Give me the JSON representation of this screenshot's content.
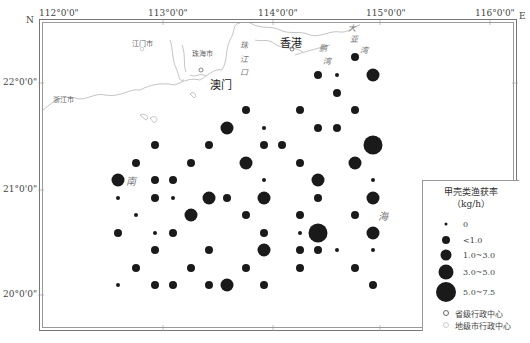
{
  "map": {
    "north_label": "N",
    "east_label": "E",
    "longitude_ticks": [
      {
        "label": "112°0'0\"",
        "x": 40
      },
      {
        "label": "113°0'0\"",
        "x": 163
      },
      {
        "label": "114°0'0\"",
        "x": 273
      },
      {
        "label": "115°0'0\"",
        "x": 380
      },
      {
        "label": "116°0'0\"",
        "x": 490
      }
    ],
    "latitude_ticks": [
      {
        "label": "22°0'0\"",
        "y": 83
      },
      {
        "label": "21°0'0\"",
        "y": 190
      },
      {
        "label": "20°0'0\"",
        "y": 295
      }
    ],
    "places": [
      {
        "name": "江门市",
        "x": 132,
        "y": 42,
        "type": "city"
      },
      {
        "name": "珠海市",
        "x": 196,
        "y": 52,
        "type": "city"
      },
      {
        "name": "浙江市",
        "x": 53,
        "y": 97,
        "type": "city"
      },
      {
        "name": "澳门",
        "x": 211,
        "y": 83,
        "type": "major"
      },
      {
        "name": "香港",
        "x": 282,
        "y": 42,
        "type": "major"
      }
    ],
    "water_labels": [
      {
        "text": "珠",
        "x": 243,
        "y": 45
      },
      {
        "text": "江",
        "x": 243,
        "y": 59
      },
      {
        "text": "口",
        "x": 243,
        "y": 72
      },
      {
        "text": "大",
        "x": 348,
        "y": 27
      },
      {
        "text": "亚",
        "x": 350,
        "y": 38
      },
      {
        "text": "湾",
        "x": 361,
        "y": 49
      },
      {
        "text": "鹏",
        "x": 320,
        "y": 47
      },
      {
        "text": "湾",
        "x": 324,
        "y": 60
      },
      {
        "text": "南",
        "x": 129,
        "y": 180
      },
      {
        "text": "海",
        "x": 382,
        "y": 215
      }
    ]
  },
  "stations": [
    {
      "x": 355,
      "y": 57,
      "size": "1.0~3.0"
    },
    {
      "x": 318,
      "y": 75,
      "size": "1.0~3.0"
    },
    {
      "x": 337,
      "y": 75,
      "size": "<1.0"
    },
    {
      "x": 373,
      "y": 75,
      "size": "3.0~5.0"
    },
    {
      "x": 337,
      "y": 93,
      "size": "1.0~3.0"
    },
    {
      "x": 246,
      "y": 110,
      "size": "1.0~3.0"
    },
    {
      "x": 300,
      "y": 110,
      "size": "1.0~3.0"
    },
    {
      "x": 355,
      "y": 110,
      "size": "1.0~3.0"
    },
    {
      "x": 227,
      "y": 128,
      "size": "3.0~5.0"
    },
    {
      "x": 264,
      "y": 128,
      "size": "<1.0"
    },
    {
      "x": 318,
      "y": 128,
      "size": "1.0~3.0"
    },
    {
      "x": 337,
      "y": 128,
      "size": "1.0~3.0"
    },
    {
      "x": 155,
      "y": 145,
      "size": "1.0~3.0"
    },
    {
      "x": 209,
      "y": 145,
      "size": "1.0~3.0"
    },
    {
      "x": 264,
      "y": 145,
      "size": "1.0~3.0"
    },
    {
      "x": 282,
      "y": 145,
      "size": "1.0~3.0"
    },
    {
      "x": 373,
      "y": 145,
      "size": "5.0~7.5"
    },
    {
      "x": 136,
      "y": 163,
      "size": "1.0~3.0"
    },
    {
      "x": 191,
      "y": 163,
      "size": "1.0~3.0"
    },
    {
      "x": 246,
      "y": 163,
      "size": "3.0~5.0"
    },
    {
      "x": 300,
      "y": 163,
      "size": "1.0~3.0"
    },
    {
      "x": 355,
      "y": 163,
      "size": "3.0~5.0"
    },
    {
      "x": 118,
      "y": 180,
      "size": "3.0~5.0"
    },
    {
      "x": 155,
      "y": 180,
      "size": "1.0~3.0"
    },
    {
      "x": 173,
      "y": 180,
      "size": "1.0~3.0"
    },
    {
      "x": 264,
      "y": 180,
      "size": "<1.0"
    },
    {
      "x": 318,
      "y": 180,
      "size": "3.0~5.0"
    },
    {
      "x": 373,
      "y": 180,
      "size": "<1.0"
    },
    {
      "x": 118,
      "y": 198,
      "size": "<1.0"
    },
    {
      "x": 155,
      "y": 198,
      "size": "1.0~3.0"
    },
    {
      "x": 173,
      "y": 198,
      "size": "<1.0"
    },
    {
      "x": 209,
      "y": 198,
      "size": "3.0~5.0"
    },
    {
      "x": 227,
      "y": 198,
      "size": "1.0~3.0"
    },
    {
      "x": 264,
      "y": 198,
      "size": "3.0~5.0"
    },
    {
      "x": 318,
      "y": 198,
      "size": "1.0~3.0"
    },
    {
      "x": 373,
      "y": 198,
      "size": "3.0~5.0"
    },
    {
      "x": 136,
      "y": 215,
      "size": "<1.0"
    },
    {
      "x": 191,
      "y": 215,
      "size": "3.0~5.0"
    },
    {
      "x": 246,
      "y": 215,
      "size": "1.0~3.0"
    },
    {
      "x": 300,
      "y": 215,
      "size": "1.0~3.0"
    },
    {
      "x": 355,
      "y": 215,
      "size": "1.0~3.0"
    },
    {
      "x": 118,
      "y": 233,
      "size": "1.0~3.0"
    },
    {
      "x": 155,
      "y": 233,
      "size": "<1.0"
    },
    {
      "x": 173,
      "y": 233,
      "size": "1.0~3.0"
    },
    {
      "x": 264,
      "y": 233,
      "size": "1.0~3.0"
    },
    {
      "x": 300,
      "y": 233,
      "size": "<1.0"
    },
    {
      "x": 318,
      "y": 233,
      "size": "5.0~7.5"
    },
    {
      "x": 373,
      "y": 233,
      "size": "3.0~5.0"
    },
    {
      "x": 155,
      "y": 250,
      "size": "1.0~3.0"
    },
    {
      "x": 209,
      "y": 250,
      "size": "1.0~3.0"
    },
    {
      "x": 264,
      "y": 250,
      "size": "3.0~5.0"
    },
    {
      "x": 300,
      "y": 250,
      "size": "1.0~3.0"
    },
    {
      "x": 318,
      "y": 250,
      "size": "1.0~3.0"
    },
    {
      "x": 337,
      "y": 250,
      "size": "<1.0"
    },
    {
      "x": 373,
      "y": 250,
      "size": "<1.0"
    },
    {
      "x": 136,
      "y": 268,
      "size": "1.0~3.0"
    },
    {
      "x": 191,
      "y": 268,
      "size": "1.0~3.0"
    },
    {
      "x": 246,
      "y": 268,
      "size": "1.0~3.0"
    },
    {
      "x": 300,
      "y": 268,
      "size": "1.0~3.0"
    },
    {
      "x": 355,
      "y": 268,
      "size": "1.0~3.0"
    },
    {
      "x": 118,
      "y": 285,
      "size": "<1.0"
    },
    {
      "x": 155,
      "y": 285,
      "size": "1.0~3.0"
    },
    {
      "x": 173,
      "y": 285,
      "size": "1.0~3.0"
    },
    {
      "x": 209,
      "y": 285,
      "size": "1.0~3.0"
    },
    {
      "x": 227,
      "y": 285,
      "size": "3.0~5.0"
    },
    {
      "x": 264,
      "y": 285,
      "size": "1.0~3.0"
    },
    {
      "x": 373,
      "y": 285,
      "size": "1.0~3.0"
    }
  ],
  "size_px": {
    "0": 3,
    "<1.0": 4,
    "1.0~3.0": 8,
    "3.0~5.0": 13,
    "5.0~7.5": 19
  },
  "legend": {
    "title": "甲壳类渔获率",
    "unit": "（kg/h）",
    "classes": [
      {
        "label": "0",
        "size": 3
      },
      {
        "label": "<1.0",
        "size": 8
      },
      {
        "label": "1.0~3.0",
        "size": 11
      },
      {
        "label": "3.0~5.0",
        "size": 15
      },
      {
        "label": "5.0~7.5",
        "size": 20
      }
    ],
    "provincial_center": "省级行政中心",
    "prefecture_center": "地级市行政中心"
  }
}
